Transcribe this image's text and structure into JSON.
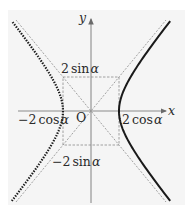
{
  "diagram": {
    "type": "hyperbola-with-asymptotes",
    "axes": {
      "x_label": "x",
      "y_label": "y",
      "origin_label": "O"
    },
    "labels": {
      "top": {
        "coef": "2",
        "fn": "sin",
        "var": "α"
      },
      "bottom": {
        "coef": "−2",
        "fn": "sin",
        "var": "α"
      },
      "left": {
        "coef": "−2",
        "fn": "cos",
        "var": "α"
      },
      "right": {
        "coef": "2",
        "fn": "cos",
        "var": "α"
      }
    },
    "geometry": {
      "center": [
        91,
        111
      ],
      "a_px": 28,
      "b_px": 34
    },
    "branches": [
      {
        "side": "left",
        "style": "dotted"
      },
      {
        "side": "right",
        "style": "solid"
      }
    ],
    "colors": {
      "panel": "#f5f5f5",
      "axis": "#8c8c8c",
      "curve": "#1a1a1a",
      "dashed": "#8a8a8a"
    }
  }
}
